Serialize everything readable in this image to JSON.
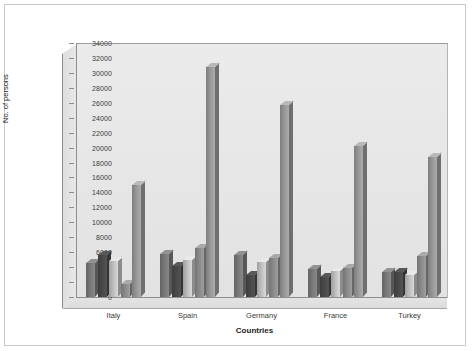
{
  "chart_data": {
    "type": "bar",
    "title": "",
    "xlabel": "Countries",
    "ylabel": "No. of persons",
    "categories": [
      "Italy",
      "Spain",
      "Germany",
      "France",
      "Turkey"
    ],
    "ylim": [
      0,
      34000
    ],
    "ytick_step": 2000,
    "yticks": [
      0,
      2000,
      4000,
      6000,
      8000,
      10000,
      12000,
      14000,
      16000,
      18000,
      20000,
      22000,
      24000,
      26000,
      28000,
      30000,
      32000,
      34000
    ],
    "grid": false,
    "legend": "none",
    "series": [
      {
        "name": "Series 1",
        "color": "#7a7a7a",
        "values": [
          4600,
          5800,
          5600,
          3700,
          3400
        ]
      },
      {
        "name": "Series 2",
        "color": "#4a4a4a",
        "values": [
          5600,
          4200,
          2900,
          2700,
          3300
        ]
      },
      {
        "name": "Series 3",
        "color": "#c2c2c2",
        "values": [
          4800,
          5000,
          4700,
          3500,
          3000
        ]
      },
      {
        "name": "Series 4",
        "color": "#8d8d8d",
        "values": [
          1800,
          6500,
          5200,
          3900,
          5500
        ]
      },
      {
        "name": "Series 5",
        "color": "#9a9a9a",
        "values": [
          15000,
          30800,
          25700,
          20200,
          18800
        ]
      }
    ]
  },
  "axis": {
    "y_title": "No. of persons",
    "x_title": "Countries",
    "tick_labels": [
      "34000",
      "32000",
      "30000",
      "28000",
      "26000",
      "24000",
      "22000",
      "20000",
      "18000",
      "16000",
      "14000",
      "12000",
      "10000",
      "8000",
      "6000",
      "4000",
      "2000",
      "0"
    ]
  }
}
